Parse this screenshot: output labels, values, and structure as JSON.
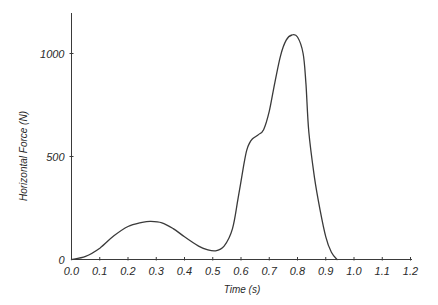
{
  "chart_data": {
    "type": "line",
    "title": "",
    "xlabel": "Time (s)",
    "ylabel": "Horizontal Force (N)",
    "xlim": [
      0.0,
      1.2
    ],
    "ylim": [
      0,
      1200
    ],
    "x_ticks": [
      "0.0",
      "0.1",
      "0.2",
      "0.3",
      "0.4",
      "0.5",
      "0.6",
      "0.7",
      "0.8",
      "0.9",
      "1.0",
      "1.1",
      "1.2"
    ],
    "y_ticks": [
      "0",
      "500",
      "1000"
    ],
    "grid": false,
    "legend": null,
    "series": [
      {
        "name": "Horizontal Force",
        "color": "#3a3a3a",
        "x": [
          0.0,
          0.05,
          0.1,
          0.15,
          0.2,
          0.25,
          0.28,
          0.32,
          0.36,
          0.4,
          0.45,
          0.48,
          0.51,
          0.54,
          0.57,
          0.59,
          0.61,
          0.62,
          0.63,
          0.64,
          0.66,
          0.68,
          0.7,
          0.72,
          0.74,
          0.76,
          0.78,
          0.8,
          0.82,
          0.83,
          0.84,
          0.86,
          0.88,
          0.9,
          0.92,
          0.94
        ],
        "values": [
          0,
          15,
          55,
          115,
          160,
          180,
          185,
          178,
          150,
          110,
          65,
          48,
          42,
          65,
          150,
          300,
          460,
          530,
          565,
          585,
          605,
          630,
          720,
          860,
          990,
          1065,
          1090,
          1080,
          1000,
          850,
          620,
          400,
          240,
          110,
          35,
          0
        ]
      }
    ]
  }
}
